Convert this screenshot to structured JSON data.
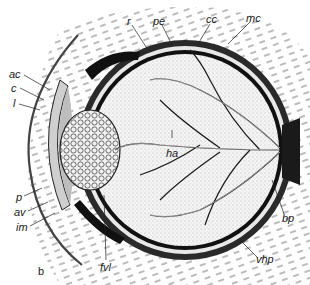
{
  "figure": {
    "panel_label": "b",
    "labels": [
      {
        "id": "r",
        "text": "r",
        "x": 127,
        "y": 16
      },
      {
        "id": "pe",
        "text": "pe",
        "x": 153,
        "y": 16
      },
      {
        "id": "cc",
        "text": "cc",
        "x": 206,
        "y": 14
      },
      {
        "id": "mc",
        "text": "mc",
        "x": 246,
        "y": 13
      },
      {
        "id": "ac",
        "text": "ac",
        "x": 9,
        "y": 69
      },
      {
        "id": "c",
        "text": "c",
        "x": 11,
        "y": 83
      },
      {
        "id": "l",
        "text": "l",
        "x": 13,
        "y": 98
      },
      {
        "id": "ha",
        "text": "ha",
        "x": 166,
        "y": 148
      },
      {
        "id": "p",
        "text": "p",
        "x": 16,
        "y": 192
      },
      {
        "id": "av",
        "text": "av",
        "x": 14,
        "y": 207
      },
      {
        "id": "im",
        "text": "im",
        "x": 16,
        "y": 222
      },
      {
        "id": "bp",
        "text": "bp",
        "x": 282,
        "y": 213
      },
      {
        "id": "vhp",
        "text": "vhp",
        "x": 256,
        "y": 254
      },
      {
        "id": "fvl",
        "text": "fvl",
        "x": 100,
        "y": 262
      }
    ]
  }
}
